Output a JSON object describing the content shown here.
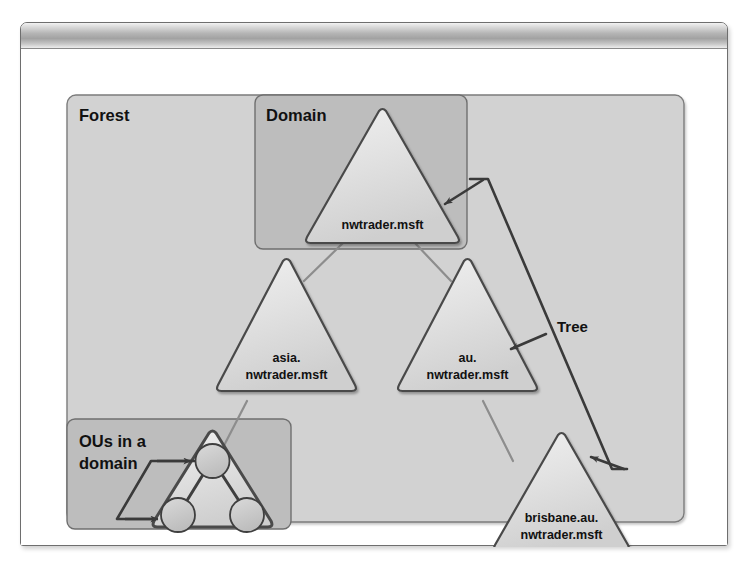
{
  "window": {
    "title": ""
  },
  "diagram": {
    "groups": [
      {
        "id": "forest",
        "label": "Forest"
      },
      {
        "id": "domain",
        "label": "Domain"
      },
      {
        "id": "ous",
        "label_line1": "OUs in a",
        "label_line2": "domain"
      }
    ],
    "annotations": [
      {
        "id": "tree",
        "label": "Tree"
      }
    ],
    "nodes": [
      {
        "id": "root",
        "line1": "nwtrader.msft",
        "line2": ""
      },
      {
        "id": "asia",
        "line1": "asia.",
        "line2": "nwtrader.msft"
      },
      {
        "id": "au",
        "line1": "au.",
        "line2": "nwtrader.msft"
      },
      {
        "id": "brisbane",
        "line1": "brisbane.au.",
        "line2": "nwtrader.msft"
      }
    ],
    "colors": {
      "forest_fill": "#d2d2d2",
      "domain_fill": "#bdbdbd",
      "ou_fill": "#bdbdbd",
      "triangle_fill": "#e0e0e0",
      "triangle_stroke": "#4a4a4a",
      "circle_fill": "#c9c9c9",
      "connector": "#8d8d8d",
      "arrow": "#3a3a3a",
      "text": "#111111",
      "page_background": "#ffffff",
      "titlebar_light": "#f2f2f2",
      "titlebar_dark": "#a2a2a2"
    }
  }
}
